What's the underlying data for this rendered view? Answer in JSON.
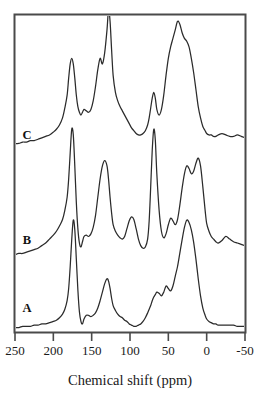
{
  "figure": {
    "axis_title": "Chemical shift (ppm)",
    "tick_labels": [
      "250",
      "200",
      "150",
      "100",
      "50",
      "0",
      "-50"
    ],
    "trace_labels": [
      "A",
      "B",
      "C"
    ],
    "line_color": "#2b2b2b",
    "frame_color": "#4a4a4a",
    "background": "#ffffff"
  },
  "chart_data": {
    "type": "line",
    "title": "",
    "subtitle": "",
    "xlabel": "Chemical shift (ppm)",
    "ylabel": "",
    "xlim": [
      250,
      -50
    ],
    "xticks": [
      250,
      200,
      150,
      100,
      50,
      0,
      -50
    ],
    "x_axis_reversed": true,
    "grid": false,
    "legend": "none",
    "annotations": [
      {
        "text": "A",
        "x": 243,
        "series": "A",
        "role": "trace-label"
      },
      {
        "text": "B",
        "x": 243,
        "series": "B",
        "role": "trace-label"
      },
      {
        "text": "C",
        "x": 243,
        "series": "C",
        "role": "trace-label"
      }
    ],
    "x": [
      250,
      245,
      240,
      235,
      230,
      225,
      220,
      215,
      210,
      205,
      200,
      196,
      192,
      188,
      185,
      182,
      180,
      178,
      176,
      174,
      172,
      170,
      168,
      166,
      164,
      162,
      160,
      157,
      154,
      151,
      148,
      145,
      142,
      139,
      136,
      133,
      130,
      128,
      126,
      124,
      122,
      119,
      116,
      113,
      110,
      107,
      104,
      101,
      98,
      95,
      92,
      89,
      86,
      83,
      80,
      77,
      75,
      73,
      71,
      69,
      67,
      65,
      62,
      59,
      56,
      53,
      50,
      47,
      44,
      41,
      38,
      35,
      32,
      29,
      26,
      23,
      20,
      17,
      14,
      11,
      8,
      5,
      2,
      0,
      -3,
      -6,
      -9,
      -12,
      -15,
      -20,
      -25,
      -30,
      -35,
      -40,
      -45,
      -50
    ],
    "series": [
      {
        "name": "A",
        "baseline_offset": 0,
        "values": [
          2,
          2,
          3,
          3,
          3,
          4,
          4,
          5,
          5,
          6,
          7,
          8,
          10,
          13,
          17,
          24,
          34,
          52,
          74,
          90,
          82,
          58,
          33,
          15,
          7,
          5,
          9,
          12,
          12,
          11,
          12,
          14,
          18,
          24,
          31,
          38,
          42,
          40,
          34,
          26,
          20,
          16,
          13,
          11,
          10,
          8,
          7,
          5,
          4,
          3,
          3,
          4,
          5,
          7,
          10,
          14,
          17,
          20,
          24,
          27,
          29,
          31,
          30,
          28,
          31,
          36,
          34,
          32,
          36,
          44,
          52,
          63,
          74,
          84,
          90,
          88,
          82,
          72,
          58,
          42,
          28,
          18,
          12,
          9,
          7,
          6,
          5,
          5,
          4,
          4,
          4,
          4,
          4,
          3,
          3,
          3
        ]
      },
      {
        "name": "B",
        "baseline_offset": 0,
        "values": [
          4,
          5,
          5,
          6,
          7,
          8,
          9,
          11,
          13,
          16,
          19,
          22,
          26,
          31,
          38,
          48,
          62,
          82,
          100,
          96,
          72,
          44,
          24,
          13,
          10,
          14,
          18,
          19,
          18,
          20,
          25,
          34,
          48,
          62,
          72,
          76,
          72,
          62,
          48,
          36,
          27,
          22,
          19,
          17,
          16,
          18,
          24,
          30,
          33,
          31,
          24,
          16,
          11,
          9,
          10,
          16,
          30,
          56,
          84,
          100,
          92,
          66,
          38,
          22,
          17,
          20,
          27,
          32,
          30,
          27,
          31,
          42,
          55,
          66,
          72,
          70,
          66,
          68,
          74,
          78,
          72,
          56,
          38,
          28,
          22,
          18,
          16,
          14,
          13,
          15,
          18,
          16,
          14,
          13,
          12,
          11
        ]
      },
      {
        "name": "C",
        "baseline_offset": 0,
        "values": [
          6,
          6,
          7,
          7,
          8,
          8,
          9,
          10,
          11,
          12,
          14,
          16,
          19,
          24,
          31,
          40,
          52,
          62,
          66,
          62,
          52,
          40,
          32,
          28,
          26,
          28,
          30,
          29,
          28,
          30,
          36,
          46,
          58,
          66,
          62,
          70,
          86,
          100,
          92,
          72,
          54,
          42,
          36,
          32,
          29,
          26,
          23,
          20,
          17,
          15,
          13,
          12,
          12,
          13,
          15,
          19,
          24,
          31,
          38,
          42,
          38,
          30,
          26,
          30,
          40,
          54,
          66,
          74,
          80,
          86,
          92,
          90,
          84,
          80,
          78,
          74,
          66,
          56,
          44,
          32,
          24,
          18,
          15,
          13,
          12,
          12,
          11,
          11,
          12,
          13,
          12,
          11,
          11,
          12,
          11,
          10
        ]
      }
    ]
  }
}
